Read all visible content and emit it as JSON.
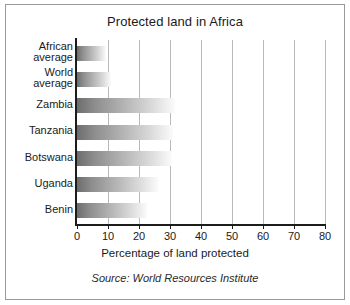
{
  "chart_data": {
    "type": "bar",
    "orientation": "horizontal",
    "title": "Protected land in Africa",
    "xlabel": "Percentage of land protected",
    "ylabel": "",
    "source": "Source: World Resources Institute",
    "xlim": [
      0,
      80
    ],
    "xticks": [
      0,
      10,
      20,
      30,
      40,
      50,
      60,
      70,
      80
    ],
    "xtick_labels": [
      "0",
      "10",
      "20",
      "30",
      "40",
      "50",
      "60",
      "70",
      "80"
    ],
    "grid": "vertical",
    "legend": "none",
    "categories": [
      "African average",
      "World average",
      "Zambia",
      "Tanzania",
      "Botswana",
      "Uganda",
      "Benin"
    ],
    "category_lines": [
      [
        "African",
        "average"
      ],
      [
        "World",
        "average"
      ],
      [
        "Zambia"
      ],
      [
        "Tanzania"
      ],
      [
        "Botswana"
      ],
      [
        "Uganda"
      ],
      [
        "Benin"
      ]
    ],
    "values": [
      9.5,
      11,
      31.5,
      31,
      30.5,
      26,
      22.5
    ],
    "bar_color_start": "#6d6d6d",
    "bar_color_end": "#fbfbfb",
    "axis_color": "#1c1c1c",
    "grid_color": "#b9b9b9",
    "frame_color": "#9a9a9a",
    "background": "#ffffff"
  }
}
